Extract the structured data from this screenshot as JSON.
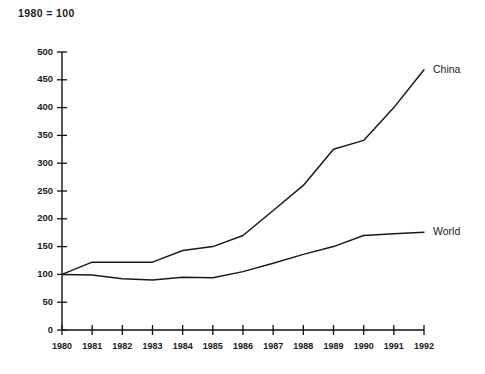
{
  "chart_data": {
    "type": "line",
    "title": "1980 = 100",
    "xlabel": "",
    "ylabel": "",
    "x": [
      1980,
      1981,
      1982,
      1983,
      1984,
      1985,
      1986,
      1987,
      1988,
      1989,
      1990,
      1991,
      1992
    ],
    "xtick_labels": [
      "1980",
      "1981",
      "1982",
      "1983",
      "1984",
      "1985",
      "1986",
      "1987",
      "1988",
      "1989",
      "1990",
      "1991",
      "1992"
    ],
    "ytick_labels": [
      "0",
      "50",
      "100",
      "150",
      "200",
      "250",
      "300",
      "350",
      "400",
      "450",
      "500"
    ],
    "yticks": [
      0,
      50,
      100,
      150,
      200,
      250,
      300,
      350,
      400,
      450,
      500
    ],
    "ylim": [
      0,
      500
    ],
    "xlim": [
      1980,
      1992
    ],
    "grid": false,
    "legend_position": "right-of-line-end",
    "line_color": "#1a1a1a",
    "series": [
      {
        "name": "China",
        "label": "China",
        "values": [
          100,
          122,
          122,
          122,
          143,
          150,
          170,
          215,
          260,
          325,
          341,
          400,
          468
        ]
      },
      {
        "name": "World",
        "label": "World",
        "values": [
          100,
          99,
          92,
          90,
          95,
          94,
          105,
          120,
          136,
          150,
          170,
          173,
          176
        ]
      }
    ]
  }
}
